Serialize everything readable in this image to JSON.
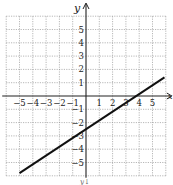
{
  "chart_data": {
    "type": "line",
    "title": "",
    "xlabel": "x",
    "ylabel": "y",
    "xlim": [
      -6,
      6
    ],
    "ylim": [
      -6,
      6
    ],
    "grid": true,
    "x_ticks": [
      -5,
      -4,
      -3,
      -2,
      -1,
      1,
      2,
      3,
      4,
      5
    ],
    "y_ticks": [
      5,
      4,
      3,
      2,
      1,
      -1,
      -2,
      -3,
      -4,
      -5
    ],
    "x_tick_labels": [
      "−5",
      "−4",
      "−3",
      "−2",
      "−1",
      "1",
      "2",
      "3",
      "4",
      "5"
    ],
    "y_tick_labels": [
      "5",
      "4",
      "3",
      "2",
      "1",
      "−1",
      "−2",
      "−3",
      "−4",
      "−5"
    ],
    "series": [
      {
        "name": "line",
        "x": [
          -5.0,
          5.9
        ],
        "y": [
          -5.8,
          1.4
        ],
        "color": "#111111"
      }
    ],
    "bottom_label": "y↓"
  },
  "labels": {
    "y_axis": "y",
    "x_axis": "x",
    "bottom": "y↓"
  }
}
